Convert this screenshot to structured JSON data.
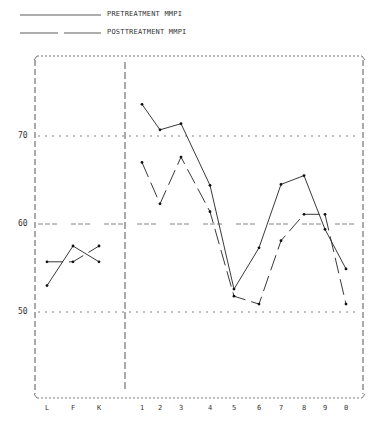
{
  "legend": {
    "pre_label": "PRETREATMENT MMPI",
    "post_label": "POSTTREATMENT MMPI"
  },
  "axes": {
    "y_ticks": [
      "70",
      "60",
      "50"
    ],
    "x_validity": [
      "L",
      "F",
      "K"
    ],
    "x_clinical": [
      "1",
      "2",
      "3",
      "4",
      "5",
      "6",
      "7",
      "8",
      "9",
      "0"
    ]
  },
  "chart_data": {
    "type": "line",
    "title": "",
    "xlabel": "",
    "ylabel": "",
    "categories": [
      "L",
      "F",
      "K",
      "1",
      "2",
      "3",
      "4",
      "5",
      "6",
      "7",
      "8",
      "9",
      "0"
    ],
    "series": [
      {
        "name": "PRETREATMENT MMPI",
        "style": "solid",
        "values": [
          53,
          57.5,
          55.7,
          73.6,
          70.7,
          71.4,
          64.4,
          52.6,
          57.3,
          64.5,
          65.5,
          59.4,
          54.9
        ]
      },
      {
        "name": "POSTTREATMENT MMPI",
        "style": "dashed",
        "values": [
          55.7,
          55.7,
          57.5,
          67,
          62.3,
          67.6,
          61.4,
          51.8,
          50.9,
          58.1,
          61.1,
          61.1,
          50.9
        ]
      }
    ],
    "groups": [
      {
        "name": "validity",
        "categories": [
          "L",
          "F",
          "K"
        ]
      },
      {
        "name": "clinical",
        "categories": [
          "1",
          "2",
          "3",
          "4",
          "5",
          "6",
          "7",
          "8",
          "9",
          "0"
        ]
      }
    ],
    "y_gridlines": [
      70,
      60,
      50
    ],
    "ylim": [
      40.5,
      80
    ],
    "legend_position": "top-left",
    "grid": true
  }
}
